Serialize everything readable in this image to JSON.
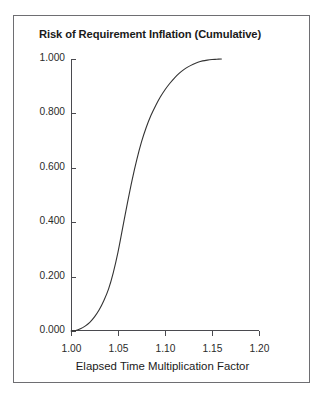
{
  "chart_data": {
    "type": "line",
    "title": "Risk of Requirement Inflation (Cumulative)",
    "xlabel": "Elapsed Time Multiplication Factor",
    "ylabel": "",
    "xlim": [
      1.0,
      1.2
    ],
    "ylim": [
      0.0,
      1.0
    ],
    "grid": false,
    "legend": null,
    "x_tick_labels": [
      "1.00",
      "1.05",
      "1.10",
      "1.15",
      "1.20"
    ],
    "x_tick_values": [
      1.0,
      1.05,
      1.1,
      1.15,
      1.2
    ],
    "y_tick_labels": [
      "0.000",
      "0.200",
      "0.400",
      "0.600",
      "0.800",
      "1.000"
    ],
    "y_tick_values": [
      0.0,
      0.2,
      0.4,
      0.6,
      0.8,
      1.0
    ],
    "series": [
      {
        "name": "Cumulative risk of requirement inflation",
        "color": "#333333",
        "x": [
          1.0,
          1.005,
          1.01,
          1.015,
          1.02,
          1.025,
          1.03,
          1.035,
          1.04,
          1.045,
          1.05,
          1.055,
          1.06,
          1.065,
          1.07,
          1.075,
          1.08,
          1.085,
          1.09,
          1.095,
          1.1,
          1.105,
          1.11,
          1.115,
          1.12,
          1.125,
          1.13,
          1.135,
          1.14,
          1.145,
          1.15,
          1.155,
          1.16
        ],
        "y": [
          0.0,
          0.002,
          0.008,
          0.018,
          0.032,
          0.052,
          0.078,
          0.112,
          0.155,
          0.215,
          0.29,
          0.38,
          0.47,
          0.555,
          0.63,
          0.695,
          0.748,
          0.792,
          0.828,
          0.86,
          0.887,
          0.91,
          0.93,
          0.947,
          0.961,
          0.972,
          0.981,
          0.988,
          0.993,
          0.996,
          0.998,
          0.999,
          1.0
        ]
      }
    ],
    "annotations": [
      {
        "label": "curve start",
        "x": 1.005,
        "y": 0.0
      },
      {
        "label": "50% crossing",
        "x": 1.062,
        "y": 0.5
      },
      {
        "label": "curve end (plateau at 1.000)",
        "x": 1.16,
        "y": 1.0
      }
    ]
  }
}
